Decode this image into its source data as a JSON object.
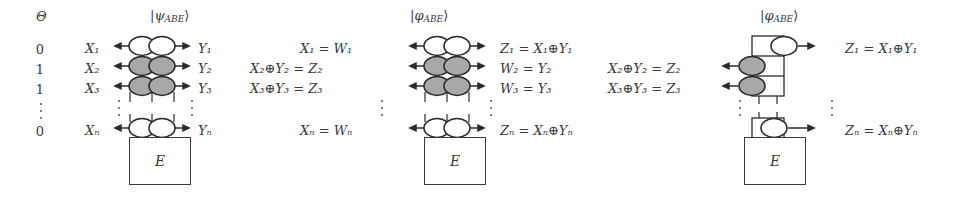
{
  "figure": {
    "theta_header": "Θ",
    "theta_values": [
      "0",
      "1",
      "1",
      "⋮",
      "0"
    ],
    "vdots": "⋮",
    "eve_box_label": "E",
    "oval_fill_shaded": "#a8a8a8",
    "oval_fill_empty": "#ffffff",
    "stroke_color": "#2b2b2b",
    "text_color": "#3a3a3a"
  },
  "panels": [
    {
      "id": "panel-psi",
      "title_bra": "|",
      "title_sym": "ψ",
      "title_sub": "ABE",
      "title_ket": "⟩",
      "columns": 2,
      "left_labels": [
        {
          "main": "X",
          "sub": "1"
        },
        {
          "main": "X",
          "sub": "2"
        },
        {
          "main": "X",
          "sub": "3"
        },
        {
          "main": "X",
          "sub": "n"
        }
      ],
      "right_labels": [
        {
          "main": "Y",
          "sub": "1"
        },
        {
          "main": "Y",
          "sub": "2"
        },
        {
          "main": "Y",
          "sub": "3"
        },
        {
          "main": "Y",
          "sub": "n"
        }
      ],
      "left_text": [
        "X₁",
        "X₂",
        "X₃",
        "Xₙ"
      ],
      "right_text": [
        "Y₁",
        "Y₂",
        "Y₃",
        "Yₙ"
      ],
      "row_shading": [
        "empty",
        "shaded",
        "shaded",
        "empty"
      ]
    },
    {
      "id": "panel-phi-mid",
      "title_bra": "|",
      "title_sym": "φ",
      "title_sub": "ABE",
      "title_ket": "⟩",
      "columns": 2,
      "left_text": [
        "X₁ = W₁",
        "X₂⊕Y₂ = Z₂",
        "X₃⊕Y₃ = Z₃",
        "Xₙ = Wₙ"
      ],
      "right_text": [
        "Z₁ = X₁⊕Y₁",
        "W₂ = Y₂",
        "W₃ = Y₃",
        "Zₙ = Xₙ⊕Yₙ"
      ],
      "row_shading": [
        "empty",
        "shaded",
        "shaded",
        "empty"
      ]
    },
    {
      "id": "panel-phi-right",
      "title_bra": "|",
      "title_sym": "φ",
      "title_sub": "ABE",
      "title_ket": "⟩",
      "columns": 1,
      "left_text": [
        "",
        "X₂⊕Y₂ = Z₂",
        "X₃⊕Y₃ = Z₃",
        ""
      ],
      "right_text": [
        "Z₁ = X₁⊕Y₁",
        "",
        "",
        "Zₙ = Xₙ⊕Yₙ"
      ],
      "row_shading": [
        "empty",
        "shaded",
        "shaded",
        "empty"
      ]
    }
  ]
}
